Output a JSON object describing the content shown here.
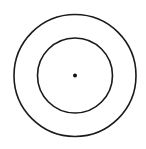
{
  "diagram": {
    "type": "concentric-circles",
    "background": "#ffffff",
    "stroke_color": "#1a1a1a",
    "center": {
      "x": 75,
      "y": 75.5
    },
    "outer_circle": {
      "radius": 61,
      "stroke_width": 1.6
    },
    "inner_circle": {
      "radius": 37.5,
      "stroke_width": 1.6
    },
    "center_dot": {
      "radius": 2,
      "fill": "#111111"
    }
  }
}
